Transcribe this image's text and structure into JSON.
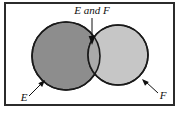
{
  "figure": {
    "type": "venn-diagram",
    "title": "",
    "background_color": "#ffffff",
    "frame": {
      "name": "figure-border",
      "color": "#2b2b2b",
      "fill": "#ffffff",
      "x": 4,
      "y": 2,
      "width": 171,
      "height": 104,
      "stroke_width": 2
    },
    "sets": [
      {
        "id": "E",
        "label": "E",
        "fill_color": "#8d8d8d",
        "stroke_color": "#1a1a1a",
        "cx": 66,
        "cy": 56,
        "r": 34
      },
      {
        "id": "F",
        "label": "F",
        "fill_color": "#c6c6c6",
        "stroke_color": "#1a1a1a",
        "cx": 118,
        "cy": 55,
        "r": 30
      }
    ],
    "intersection": {
      "id": "E_and_F",
      "label": "E and F",
      "fill_color": "#a9a9a9"
    },
    "annotations": [
      {
        "name": "intersection-callout",
        "text": "E and F",
        "text_x": 92,
        "text_y": 14,
        "font_size": 11,
        "anchor": "middle",
        "arrow_from_x": 92,
        "arrow_from_y": 18,
        "arrow_to_x": 92,
        "arrow_to_y": 43
      },
      {
        "name": "set-e-callout",
        "text": "E",
        "text_x": 24,
        "text_y": 101,
        "font_size": 11,
        "anchor": "middle",
        "arrow_from_x": 29,
        "arrow_from_y": 95,
        "arrow_to_x": 44,
        "arrow_to_y": 80
      },
      {
        "name": "set-f-callout",
        "text": "F",
        "text_x": 163,
        "text_y": 99,
        "font_size": 11,
        "anchor": "middle",
        "arrow_from_x": 158,
        "arrow_from_y": 93,
        "arrow_to_x": 143,
        "arrow_to_y": 79
      }
    ]
  }
}
